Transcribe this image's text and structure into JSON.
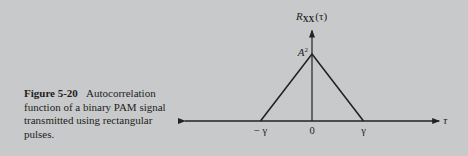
{
  "caption": {
    "figure_label": "Figure 5-20",
    "text": "Autocorrelation function of a binary PAM signal transmitted using rectangular pulses."
  },
  "chart_data": {
    "type": "line",
    "title": "",
    "ylabel": "R_XX(τ)",
    "ylabel_parts": {
      "R": "R",
      "sub": "XX",
      "arg": "(τ)"
    },
    "xlabel": "τ",
    "x_ticks": [
      {
        "value": -1,
        "label": "− γ"
      },
      {
        "value": 0,
        "label": "0"
      },
      {
        "value": 1,
        "label": "γ"
      }
    ],
    "y_ticks": [
      {
        "value": 1,
        "label": "A",
        "sup": "2"
      }
    ],
    "series": [
      {
        "name": "R_XX(τ)",
        "x": [
          -2.45,
          -1,
          0,
          1,
          2.45
        ],
        "y": [
          0,
          0,
          1,
          0,
          0
        ]
      }
    ],
    "xlim": [
      -2.45,
      2.45
    ],
    "ylim": [
      0,
      1.35
    ],
    "grid": false,
    "legend": "none"
  }
}
